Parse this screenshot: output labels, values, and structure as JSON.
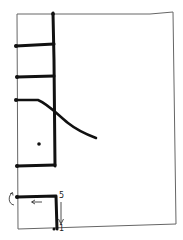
{
  "diagram": {
    "type": "hand-drawn stitching diagram",
    "colors": {
      "ink": "#111111",
      "page_outline": "#555555",
      "background": "#ffffff"
    },
    "page_outline": {
      "corners": [
        [
          17,
          14
        ],
        [
          173,
          12
        ],
        [
          176,
          224
        ],
        [
          18,
          229
        ]
      ]
    },
    "spine": {
      "x": 54,
      "y_top": 13,
      "y_bottom": 166
    },
    "stitches": [
      {
        "name": "stitch-1",
        "y": 46
      },
      {
        "name": "stitch-2",
        "y": 77
      },
      {
        "name": "stitch-3-curved",
        "y": 100
      },
      {
        "name": "stitch-4",
        "y": 166
      }
    ],
    "dot": {
      "x": 39,
      "y": 144
    },
    "detail": {
      "label_top": "5",
      "label_bottom": "1",
      "arrow_down": "↓",
      "arrow_left": "←",
      "arrow_curved": "↶"
    }
  }
}
